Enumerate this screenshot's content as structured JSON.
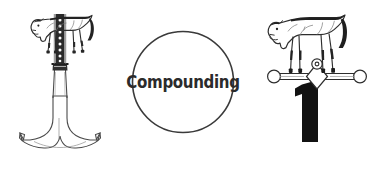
{
  "canvas": {
    "width": 376,
    "height": 175,
    "background_color": "#ffffff"
  },
  "palette": {
    "ink": "#2b2b2b",
    "outline": "#3a3a3a",
    "solid_black": "#111111",
    "shade": "#6e6e6e",
    "background": "#ffffff"
  },
  "left_figure": {
    "name": "horse-on-anchor-post",
    "description": "Line-drawn horse standing atop a tall ornamented post rising from a flared anchor-shaped base",
    "parts": {
      "horse": "horse-left-facing",
      "post": "ornamented-vertical-post",
      "collar": "post-collar",
      "base": "anchor-base"
    }
  },
  "center_badge": {
    "name": "compounding-circle",
    "label": "Compounding",
    "shape": "circle",
    "stroke_color": "#3a3a3a",
    "stroke_width": 1.6,
    "fill": "#ffffff"
  },
  "right_figure": {
    "name": "horse-on-balance-bar",
    "description": "Line-drawn horse standing on a horizontal balance bar with ball ends, a bold numeral below",
    "numeral": "1",
    "parts": {
      "horse": "horse-left-facing",
      "bar": "balance-bar",
      "left_ball": "bar-ball-left",
      "right_ball": "bar-ball-right",
      "pivot": "bar-pivot-diamond",
      "ring": "pivot-ring",
      "numeral": "numeral-one"
    }
  }
}
